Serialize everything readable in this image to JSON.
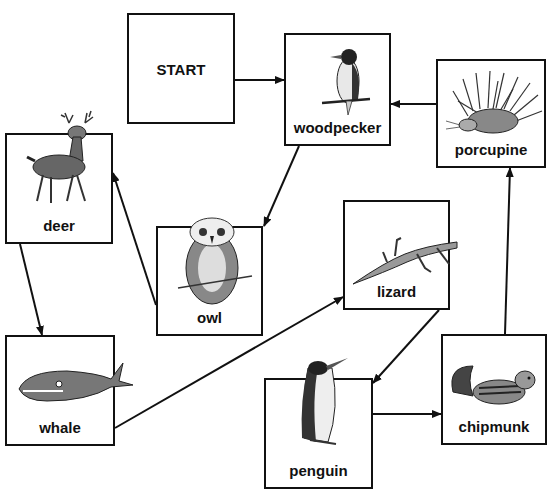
{
  "diagram": {
    "type": "flowchart",
    "nodes": [
      {
        "id": "start",
        "label": "START"
      },
      {
        "id": "woodpecker",
        "label": "woodpecker"
      },
      {
        "id": "porcupine",
        "label": "porcupine"
      },
      {
        "id": "deer",
        "label": "deer"
      },
      {
        "id": "owl",
        "label": "owl"
      },
      {
        "id": "lizard",
        "label": "lizard"
      },
      {
        "id": "whale",
        "label": "whale"
      },
      {
        "id": "penguin",
        "label": "penguin"
      },
      {
        "id": "chipmunk",
        "label": "chipmunk"
      }
    ],
    "edges": [
      {
        "from": "start",
        "to": "woodpecker"
      },
      {
        "from": "woodpecker",
        "to": "owl"
      },
      {
        "from": "owl",
        "to": "deer"
      },
      {
        "from": "deer",
        "to": "whale"
      },
      {
        "from": "whale",
        "to": "lizard"
      },
      {
        "from": "lizard",
        "to": "penguin"
      },
      {
        "from": "penguin",
        "to": "chipmunk"
      },
      {
        "from": "chipmunk",
        "to": "porcupine"
      },
      {
        "from": "porcupine",
        "to": "woodpecker"
      }
    ]
  },
  "labels": {
    "start": "START",
    "woodpecker": "woodpecker",
    "porcupine": "porcupine",
    "deer": "deer",
    "owl": "owl",
    "lizard": "lizard",
    "whale": "whale",
    "penguin": "penguin",
    "chipmunk": "chipmunk"
  }
}
